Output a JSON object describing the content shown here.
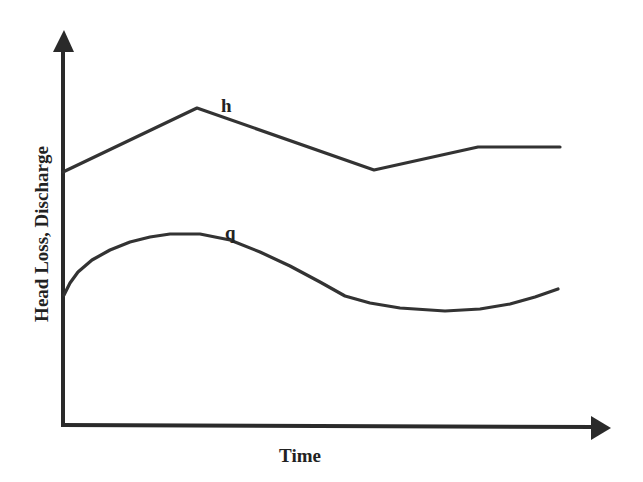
{
  "chart_data": {
    "type": "line",
    "title": "",
    "xlabel": "Time",
    "ylabel": "Head Loss, Discharge",
    "grid": false,
    "legend": "none (inline series labels)",
    "ticks": {
      "x": [],
      "y": []
    },
    "colors": {
      "line": "#333333",
      "axis": "#2a2a2a",
      "background": "#ffffff"
    },
    "series": [
      {
        "name": "h",
        "label": "h",
        "description": "Head loss: piecewise linear — rises, falls, rises, then constant",
        "points_px": [
          [
            63,
            172
          ],
          [
            197,
            108
          ],
          [
            374,
            170
          ],
          [
            478,
            147
          ],
          [
            560,
            147
          ]
        ],
        "label_pos_px": [
          227,
          112
        ]
      },
      {
        "name": "q",
        "label": "q",
        "description": "Discharge: smooth curve — rises to a plateau, falls to a minimum, rises again",
        "points_px": [
          [
            64,
            295
          ],
          [
            70,
            283
          ],
          [
            78,
            272
          ],
          [
            92,
            260
          ],
          [
            110,
            250
          ],
          [
            130,
            242
          ],
          [
            150,
            237
          ],
          [
            170,
            234
          ],
          [
            200,
            234
          ],
          [
            230,
            240
          ],
          [
            260,
            252
          ],
          [
            290,
            266
          ],
          [
            320,
            282
          ],
          [
            345,
            296
          ],
          [
            370,
            303
          ],
          [
            400,
            308
          ],
          [
            445,
            311
          ],
          [
            480,
            309
          ],
          [
            510,
            304
          ],
          [
            535,
            297
          ],
          [
            558,
            289
          ]
        ],
        "label_pos_px": [
          231,
          240
        ]
      }
    ]
  }
}
